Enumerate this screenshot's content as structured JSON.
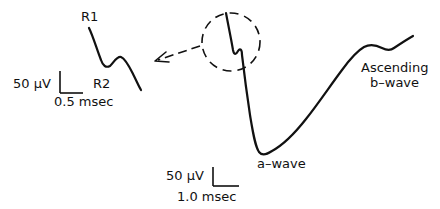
{
  "figure": {
    "type": "ERG waveform schematic",
    "ink_color": "#111111",
    "background": "#ffffff"
  },
  "inset": {
    "labels": {
      "r1": "R1",
      "r2": "R2"
    },
    "scale_bar": {
      "voltage": "50 μV",
      "time": "0.5 msec"
    }
  },
  "main_trace": {
    "labels": {
      "a_wave": "a–wave",
      "b_wave_line1": "Ascending",
      "b_wave_line2": "b–wave"
    },
    "scale_bar": {
      "voltage": "50 μV",
      "time": "1.0 msec"
    }
  },
  "callout": {
    "description": "dashed circle around early receptor potential with dashed arrow pointing to magnified inset"
  }
}
